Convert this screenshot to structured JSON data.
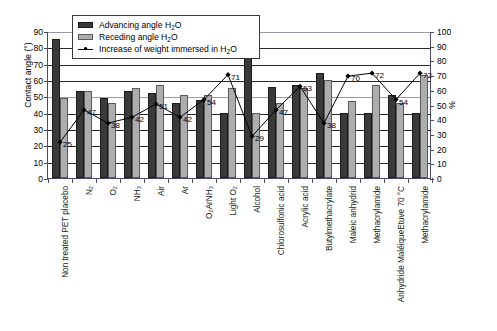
{
  "chart_data": {
    "type": "bar",
    "title": "",
    "subtitle": "",
    "xlabel": "",
    "ylabel": "Contact angle (°)",
    "ylabel_right": "%",
    "ylim": [
      0,
      90
    ],
    "ylim_right": [
      0,
      100
    ],
    "yticks": [
      0,
      10,
      20,
      30,
      40,
      50,
      60,
      70,
      80,
      90
    ],
    "yticks_right": [
      0,
      10,
      20,
      30,
      40,
      50,
      60,
      70,
      80,
      90,
      100
    ],
    "grid": true,
    "legend_position": "top-center",
    "categories": [
      "Non treated PET placebo",
      "N₂",
      "O₂",
      "NH₃",
      "Air",
      "Ar",
      "O₂ArNH₃",
      "Light O₂",
      "Alcohol",
      "Chlorosulfonic acid",
      "Acrylic acid",
      "Butylmethacrylate",
      "Maleic anhydrid",
      "Methacrylamide",
      "Anhydride MaléiqueEtuve 70 °C",
      "Methacrylamide"
    ],
    "series": [
      {
        "name": "Advancing angle H₂O",
        "type": "bar",
        "color": "#3a3a3a",
        "axis": "left",
        "values": [
          85,
          53,
          49,
          53,
          52,
          46,
          48,
          40,
          78,
          56,
          57,
          64,
          40,
          40,
          51,
          40
        ]
      },
      {
        "name": "Receding angle H₂O",
        "type": "bar",
        "color": "#adadad",
        "axis": "left",
        "values": [
          49,
          53,
          46,
          55,
          57,
          51,
          51,
          55,
          40,
          46,
          55,
          60,
          47,
          57,
          46,
          63
        ]
      },
      {
        "name": "Increase of weight immersed in H₂O",
        "type": "line",
        "color": "#000000",
        "axis": "right",
        "marker": "diamond",
        "values": [
          25,
          47,
          38,
          42,
          51,
          42,
          54,
          71,
          29,
          47,
          63,
          38,
          70,
          72,
          54,
          72
        ],
        "point_labels": [
          "25",
          "47",
          "38",
          "42",
          "51",
          "42",
          "54",
          "71",
          "29",
          "47",
          "63",
          "38",
          "70",
          "72",
          "54",
          "72"
        ]
      }
    ]
  },
  "legend": {
    "items": [
      {
        "key": "adv",
        "label_html": "Advancing angle H<sub>2</sub>O"
      },
      {
        "key": "rec",
        "label_html": "Receding angle H<sub>2</sub>O"
      },
      {
        "key": "line",
        "label_html": "Increase of weight immersed in H<sub>2</sub>O"
      }
    ]
  },
  "colors": {
    "advancing_bar": "#3a3a3a",
    "receding_bar": "#adadad",
    "line": "#000000",
    "axis": "#4a4a6a",
    "grid": "#2a2a2a",
    "background": "#ffffff"
  }
}
